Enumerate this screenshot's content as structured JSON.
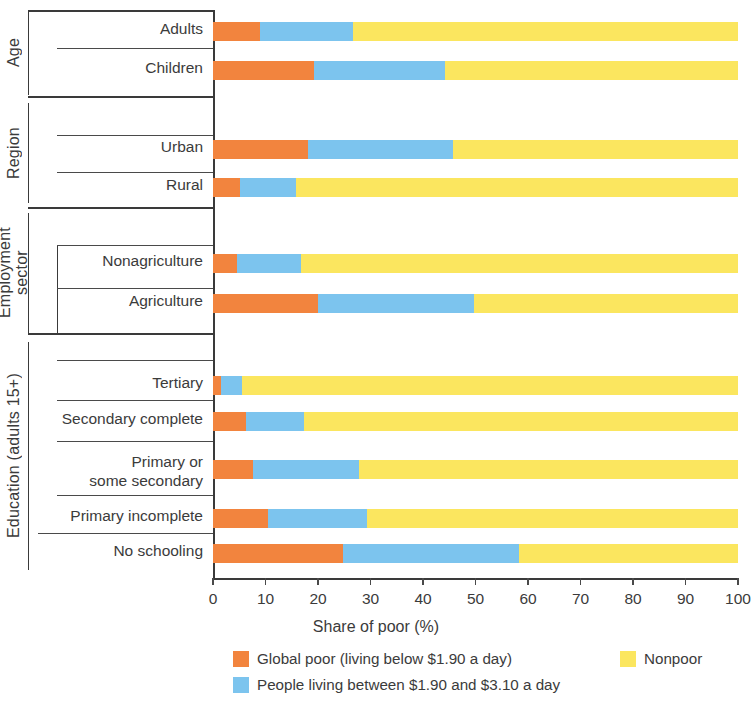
{
  "chart_data": {
    "type": "bar",
    "orientation": "horizontal",
    "stacked": true,
    "title": "",
    "xlabel": "Share of poor (%)",
    "ylabel": "",
    "xlim": [
      0,
      100
    ],
    "xticks": [
      0,
      10,
      20,
      30,
      40,
      50,
      60,
      70,
      80,
      90,
      100
    ],
    "grid": false,
    "legend_position": "bottom",
    "series": [
      {
        "name": "Global poor (living below $1.90 a day)",
        "color": "#f2843e",
        "values": [
          9.0,
          19.3,
          18.1,
          5.2,
          4.5,
          20.0,
          1.5,
          6.3,
          7.6,
          10.5,
          24.8
        ]
      },
      {
        "name": "People living between $1.90 and $3.10 a day",
        "color": "#7cc4ee",
        "values": [
          17.7,
          24.8,
          27.7,
          10.6,
          12.3,
          29.7,
          4.1,
          11.1,
          20.3,
          18.9,
          33.4
        ]
      },
      {
        "name": "Nonpoor",
        "color": "#fbe65f",
        "values": [
          73.3,
          55.9,
          54.2,
          84.2,
          83.2,
          50.3,
          94.4,
          82.6,
          72.1,
          70.6,
          41.8
        ]
      }
    ],
    "categories": [
      "Adults",
      "Children",
      "Urban",
      "Rural",
      "Nonagriculture",
      "Agriculture",
      "Tertiary",
      "Secondary complete",
      "Primary or\nsome secondary",
      "Primary incomplete",
      "No schooling"
    ],
    "groups": [
      {
        "label": "Age",
        "categories": [
          "Adults",
          "Children"
        ]
      },
      {
        "label": "Region",
        "categories": [
          "Urban",
          "Rural"
        ]
      },
      {
        "label": "Employment\nsector",
        "categories": [
          "Nonagriculture",
          "Agriculture"
        ]
      },
      {
        "label": "Education (adults 15+)",
        "categories": [
          "Tertiary",
          "Secondary complete",
          "Primary or\nsome secondary",
          "Primary incomplete",
          "No schooling"
        ]
      }
    ]
  },
  "axis": {
    "x_title": "Share of poor (%)",
    "tick_labels": [
      "0",
      "10",
      "20",
      "30",
      "40",
      "50",
      "60",
      "70",
      "80",
      "90",
      "100"
    ]
  },
  "groups": {
    "age": "Age",
    "region": "Region",
    "employment": "Employment\nsector",
    "education": "Education (adults 15+)"
  },
  "categories": {
    "adults": "Adults",
    "children": "Children",
    "urban": "Urban",
    "rural": "Rural",
    "nonagriculture": "Nonagriculture",
    "agriculture": "Agriculture",
    "tertiary": "Tertiary",
    "secondary_complete": "Secondary complete",
    "primary_or_some_secondary": "Primary or\nsome secondary",
    "primary_incomplete": "Primary incomplete",
    "no_schooling": "No schooling"
  },
  "legend": {
    "items": [
      {
        "label": "Global poor (living below $1.90 a day)",
        "color": "#f2843e"
      },
      {
        "label": "People living between $1.90 and $3.10 a day",
        "color": "#7cc4ee"
      },
      {
        "label": "Nonpoor",
        "color": "#fbe65f"
      }
    ]
  },
  "colors": {
    "global_poor": "#f2843e",
    "between": "#7cc4ee",
    "nonpoor": "#fbe65f",
    "axis": "#3a3a3a",
    "text": "#3b3b3b"
  }
}
